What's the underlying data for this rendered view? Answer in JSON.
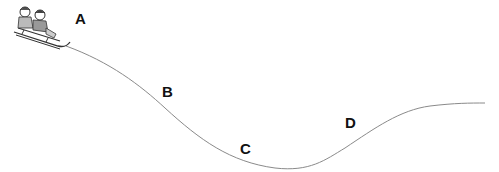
{
  "diagram": {
    "points": [
      {
        "id": "A",
        "label": "A",
        "x": 75,
        "y": 11
      },
      {
        "id": "B",
        "label": "B",
        "x": 162,
        "y": 84
      },
      {
        "id": "C",
        "label": "C",
        "x": 240,
        "y": 141
      },
      {
        "id": "D",
        "label": "D",
        "x": 345,
        "y": 115
      }
    ],
    "track_color": "#8a8a8a",
    "figure": "two-children-on-sled-icon"
  }
}
